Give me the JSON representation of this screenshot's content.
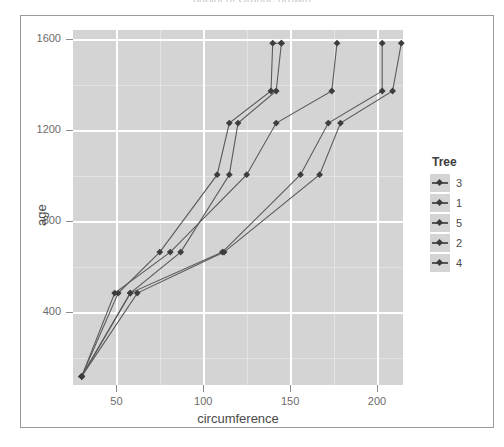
{
  "clipped_caption": "ggplot of Orange growth",
  "chart_data": {
    "type": "line",
    "title": "",
    "xlabel": "circumference",
    "ylabel": "age",
    "xlim": [
      25,
      215
    ],
    "ylim": [
      80,
      1640
    ],
    "xticks": [
      50,
      100,
      150,
      200
    ],
    "yticks": [
      400,
      800,
      1200,
      1600
    ],
    "grid": true,
    "legend_title": "Tree",
    "legend_position": "right",
    "legend_order": [
      "3",
      "1",
      "5",
      "2",
      "4"
    ],
    "point_color": "#3d3d3d",
    "line_color": "#5a5a5a",
    "panel_color": "#d4d4d4",
    "series": [
      {
        "name": "3",
        "x": [
          30,
          51,
          75,
          108,
          115,
          139,
          140,
          145
        ],
        "y": [
          118,
          484,
          664,
          1004,
          1231,
          1372,
          1582,
          1582
        ]
      },
      {
        "name": "1",
        "x": [
          30,
          58,
          87,
          115,
          120,
          142,
          145
        ],
        "y": [
          118,
          484,
          664,
          1004,
          1231,
          1372,
          1582
        ]
      },
      {
        "name": "5",
        "x": [
          30,
          49,
          81,
          125,
          142,
          174,
          177
        ],
        "y": [
          118,
          484,
          664,
          1004,
          1231,
          1372,
          1582
        ]
      },
      {
        "name": "2",
        "x": [
          30,
          62,
          112,
          167,
          179,
          209,
          214
        ],
        "y": [
          118,
          484,
          664,
          1004,
          1231,
          1372,
          1582
        ]
      },
      {
        "name": "4",
        "x": [
          30,
          58,
          111,
          156,
          172,
          203,
          203
        ],
        "y": [
          118,
          484,
          664,
          1004,
          1231,
          1372,
          1582
        ]
      }
    ]
  }
}
